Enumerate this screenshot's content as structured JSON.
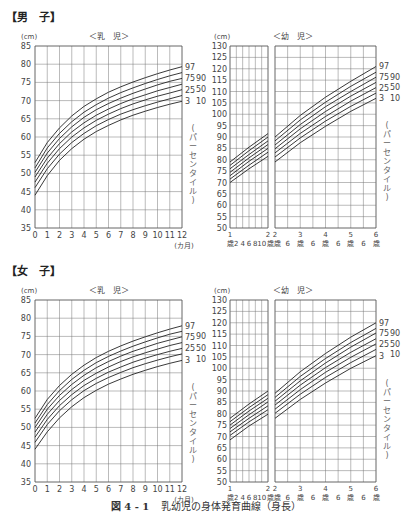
{
  "page": {
    "caption_fig": "図 4 - 1",
    "caption_text": "乳幼児の身体発育曲線（身長）"
  },
  "sections": [
    {
      "title": "【男　子】",
      "top": 8
    },
    {
      "title": "【女　子】",
      "top": 262
    }
  ],
  "labels": {
    "unit": "(cm)",
    "infant_title": "＜乳　児＞",
    "toddler_title": "＜幼　児＞",
    "months_unit": "(カ月)",
    "percentile_vertical": "(パーセンタイル)",
    "percentiles": [
      "97",
      "90",
      "75",
      "50",
      "25",
      "10",
      "3"
    ]
  },
  "chart_data": [
    {
      "id": "boys-infant",
      "type": "line",
      "title": "男子 ＜乳児＞ 身長",
      "xlabel": "(カ月)",
      "ylabel": "(cm)",
      "x": [
        0,
        1,
        2,
        3,
        4,
        5,
        6,
        7,
        8,
        9,
        10,
        11,
        12
      ],
      "xlim": [
        0,
        12
      ],
      "ylim": [
        35,
        85
      ],
      "yticks": [
        35,
        40,
        45,
        50,
        55,
        60,
        65,
        70,
        75,
        80,
        85
      ],
      "grid": true,
      "legend_position": "right",
      "series": [
        {
          "name": "97",
          "values": [
            53.0,
            58.5,
            62.5,
            65.8,
            68.4,
            70.5,
            72.3,
            73.8,
            75.1,
            76.3,
            77.4,
            78.4,
            79.3
          ]
        },
        {
          "name": "90",
          "values": [
            51.5,
            57.0,
            61.0,
            64.2,
            66.8,
            68.9,
            70.7,
            72.2,
            73.5,
            74.7,
            75.8,
            76.8,
            77.7
          ]
        },
        {
          "name": "75",
          "values": [
            50.3,
            55.6,
            59.6,
            62.8,
            65.4,
            67.5,
            69.2,
            70.7,
            72.0,
            73.2,
            74.3,
            75.3,
            76.1
          ]
        },
        {
          "name": "50",
          "values": [
            49.0,
            54.2,
            58.2,
            61.4,
            63.9,
            66.0,
            67.7,
            69.2,
            70.5,
            71.6,
            72.7,
            73.6,
            74.5
          ]
        },
        {
          "name": "25",
          "values": [
            47.6,
            52.8,
            56.8,
            60.0,
            62.5,
            64.6,
            66.3,
            67.8,
            69.1,
            70.2,
            71.2,
            72.1,
            73.0
          ]
        },
        {
          "name": "10",
          "values": [
            46.1,
            51.3,
            55.3,
            58.5,
            61.0,
            63.1,
            64.8,
            66.3,
            67.5,
            68.6,
            69.6,
            70.5,
            71.4
          ]
        },
        {
          "name": "3",
          "values": [
            44.0,
            49.4,
            53.6,
            56.8,
            59.4,
            61.5,
            63.2,
            64.7,
            66.0,
            67.1,
            68.1,
            69.0,
            69.8
          ]
        }
      ]
    },
    {
      "id": "boys-toddler",
      "type": "line",
      "title": "男子 ＜幼児＞ 身長",
      "xlabel": "歳",
      "ylabel": "(cm)",
      "ylim": [
        50,
        130
      ],
      "yticks": [
        50,
        55,
        60,
        65,
        70,
        75,
        80,
        85,
        90,
        95,
        100,
        105,
        110,
        115,
        120,
        125,
        130
      ],
      "grid": true,
      "legend_position": "right",
      "x_left_panel": {
        "range_years": [
          1,
          2
        ],
        "tick_labels": [
          "1歳",
          "2",
          "4",
          "6",
          "8",
          "10",
          "2歳"
        ]
      },
      "x_right_panel": {
        "range_years": [
          2,
          6
        ],
        "tick_labels": [
          "2歳",
          "6",
          "3歳",
          "6",
          "4歳",
          "6",
          "5歳",
          "6",
          "6歳"
        ]
      },
      "x_years_left": [
        1,
        1.5,
        2
      ],
      "x_years_right": [
        2,
        3,
        4,
        5,
        6
      ],
      "series": [
        {
          "name": "97",
          "left": [
            79.0,
            85.5,
            91.5
          ],
          "right": [
            90.0,
            99.5,
            107.5,
            114.5,
            121.0
          ]
        },
        {
          "name": "90",
          "left": [
            77.5,
            84.0,
            90.0
          ],
          "right": [
            88.3,
            97.5,
            105.3,
            112.3,
            118.5
          ]
        },
        {
          "name": "75",
          "left": [
            76.0,
            82.3,
            88.3
          ],
          "right": [
            86.5,
            95.5,
            103.3,
            110.0,
            116.3
          ]
        },
        {
          "name": "50",
          "left": [
            74.5,
            80.8,
            86.7
          ],
          "right": [
            84.8,
            93.6,
            101.2,
            108.0,
            114.0
          ]
        },
        {
          "name": "25",
          "left": [
            73.0,
            79.3,
            85.0
          ],
          "right": [
            83.0,
            91.6,
            99.0,
            105.8,
            111.7
          ]
        },
        {
          "name": "10",
          "left": [
            71.5,
            77.6,
            83.3
          ],
          "right": [
            81.2,
            89.6,
            97.0,
            103.5,
            109.3
          ]
        },
        {
          "name": "3",
          "left": [
            70.0,
            76.0,
            81.5
          ],
          "right": [
            79.0,
            87.5,
            94.7,
            101.3,
            107.0
          ]
        }
      ]
    },
    {
      "id": "girls-infant",
      "type": "line",
      "title": "女子 ＜乳児＞ 身長",
      "xlabel": "(カ月)",
      "ylabel": "(cm)",
      "x": [
        0,
        1,
        2,
        3,
        4,
        5,
        6,
        7,
        8,
        9,
        10,
        11,
        12
      ],
      "xlim": [
        0,
        12
      ],
      "ylim": [
        35,
        85
      ],
      "yticks": [
        35,
        40,
        45,
        50,
        55,
        60,
        65,
        70,
        75,
        80,
        85
      ],
      "grid": true,
      "legend_position": "right",
      "series": [
        {
          "name": "97",
          "values": [
            52.5,
            57.7,
            61.5,
            64.6,
            67.1,
            69.2,
            70.9,
            72.4,
            73.7,
            74.9,
            76.0,
            77.0,
            77.9
          ]
        },
        {
          "name": "90",
          "values": [
            51.2,
            56.3,
            60.1,
            63.2,
            65.7,
            67.8,
            69.5,
            71.0,
            72.3,
            73.5,
            74.6,
            75.6,
            76.4
          ]
        },
        {
          "name": "75",
          "values": [
            50.0,
            55.0,
            58.8,
            61.8,
            64.3,
            66.4,
            68.1,
            69.6,
            70.9,
            72.0,
            73.1,
            74.0,
            74.9
          ]
        },
        {
          "name": "50",
          "values": [
            48.7,
            53.6,
            57.4,
            60.4,
            62.9,
            64.9,
            66.6,
            68.1,
            69.4,
            70.5,
            71.5,
            72.5,
            73.3
          ]
        },
        {
          "name": "25",
          "values": [
            47.3,
            52.2,
            56.0,
            59.0,
            61.5,
            63.5,
            65.2,
            66.6,
            67.9,
            69.0,
            70.0,
            70.9,
            71.7
          ]
        },
        {
          "name": "10",
          "values": [
            45.9,
            50.8,
            54.6,
            57.6,
            60.1,
            62.1,
            63.7,
            65.1,
            66.4,
            67.5,
            68.5,
            69.4,
            70.2
          ]
        },
        {
          "name": "3",
          "values": [
            44.0,
            48.8,
            52.6,
            55.7,
            58.2,
            60.2,
            61.9,
            63.3,
            64.6,
            65.7,
            66.7,
            67.6,
            68.4
          ]
        }
      ]
    },
    {
      "id": "girls-toddler",
      "type": "line",
      "title": "女子 ＜幼児＞ 身長",
      "xlabel": "歳",
      "ylabel": "(cm)",
      "ylim": [
        50,
        130
      ],
      "yticks": [
        50,
        55,
        60,
        65,
        70,
        75,
        80,
        85,
        90,
        95,
        100,
        105,
        110,
        115,
        120,
        125,
        130
      ],
      "grid": true,
      "legend_position": "right",
      "x_left_panel": {
        "range_years": [
          1,
          2
        ],
        "tick_labels": [
          "1歳",
          "2",
          "4",
          "6",
          "8",
          "10",
          "2歳"
        ]
      },
      "x_right_panel": {
        "range_years": [
          2,
          6
        ],
        "tick_labels": [
          "2歳",
          "6",
          "3歳",
          "6",
          "4歳",
          "6",
          "5歳",
          "6",
          "6歳"
        ]
      },
      "x_years_left": [
        1,
        1.5,
        2
      ],
      "x_years_right": [
        2,
        3,
        4,
        5,
        6
      ],
      "series": [
        {
          "name": "97",
          "left": [
            78.0,
            84.3,
            90.0
          ],
          "right": [
            89.0,
            98.5,
            106.5,
            113.7,
            120.0
          ]
        },
        {
          "name": "90",
          "left": [
            76.5,
            82.7,
            88.4
          ],
          "right": [
            87.2,
            96.4,
            104.3,
            111.3,
            117.5
          ]
        },
        {
          "name": "75",
          "left": [
            75.0,
            81.2,
            86.8
          ],
          "right": [
            85.5,
            94.5,
            102.3,
            109.3,
            115.5
          ]
        },
        {
          "name": "50",
          "left": [
            73.5,
            79.6,
            85.2
          ],
          "right": [
            83.8,
            92.6,
            100.3,
            107.0,
            113.0
          ]
        },
        {
          "name": "25",
          "left": [
            72.0,
            78.0,
            83.5
          ],
          "right": [
            82.0,
            90.6,
            98.2,
            104.8,
            110.7
          ]
        },
        {
          "name": "10",
          "left": [
            70.5,
            76.4,
            81.8
          ],
          "right": [
            80.2,
            88.6,
            96.0,
            102.5,
            108.3
          ]
        },
        {
          "name": "3",
          "left": [
            68.5,
            74.6,
            79.8
          ],
          "right": [
            78.0,
            86.3,
            93.5,
            100.0,
            105.5
          ]
        }
      ]
    }
  ]
}
